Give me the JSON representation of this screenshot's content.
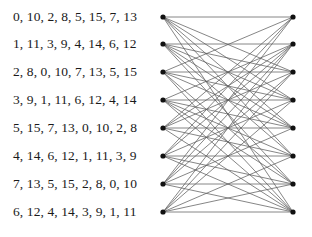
{
  "figure": {
    "width": 312,
    "height": 237,
    "background_color": "#ffffff",
    "node_color": "#111111",
    "edge_color": "#5e5e5e",
    "text_color": "#1a1a1a"
  },
  "labels": {
    "rows": [
      {
        "id": "row-1",
        "text": "0, 10, 2, 8, 5, 15, 7, 13",
        "values": [
          0,
          10,
          2,
          8,
          5,
          15,
          7,
          13
        ],
        "y": 17
      },
      {
        "id": "row-2",
        "text": "1, 11, 3, 9, 4, 14, 6, 12",
        "values": [
          1,
          11,
          3,
          9,
          4,
          14,
          6,
          12
        ],
        "y": 44
      },
      {
        "id": "row-3",
        "text": "2, 8, 0, 10, 7, 13, 5, 15",
        "values": [
          2,
          8,
          0,
          10,
          7,
          13,
          5,
          15
        ],
        "y": 72
      },
      {
        "id": "row-4",
        "text": "3, 9, 1, 11, 6, 12, 4, 14",
        "values": [
          3,
          9,
          1,
          11,
          6,
          12,
          4,
          14
        ],
        "y": 100
      },
      {
        "id": "row-5",
        "text": "5, 15, 7, 13, 0, 10, 2, 8",
        "values": [
          5,
          15,
          7,
          13,
          0,
          10,
          2,
          8
        ],
        "y": 128
      },
      {
        "id": "row-6",
        "text": "4, 14, 6, 12, 1, 11, 3, 9",
        "values": [
          4,
          14,
          6,
          12,
          1,
          11,
          3,
          9
        ],
        "y": 156
      },
      {
        "id": "row-7",
        "text": "7, 13, 5, 15, 2, 8, 0, 10",
        "values": [
          7,
          13,
          5,
          15,
          2,
          8,
          0,
          10
        ],
        "y": 184
      },
      {
        "id": "row-8",
        "text": "6, 12, 4, 14, 3, 9, 1, 11",
        "values": [
          6,
          12,
          4,
          14,
          3,
          9,
          1,
          11
        ],
        "y": 212
      }
    ]
  },
  "chart_data": {
    "type": "diagram",
    "subtype": "bipartite-graph",
    "title": "",
    "xlabel": "",
    "ylabel": "",
    "node_radius": 2.6,
    "left_nodes": [
      {
        "id": "L1",
        "x": 163,
        "y": 17
      },
      {
        "id": "L2",
        "x": 163,
        "y": 44
      },
      {
        "id": "L3",
        "x": 163,
        "y": 72
      },
      {
        "id": "L4",
        "x": 163,
        "y": 100
      },
      {
        "id": "L5",
        "x": 163,
        "y": 128
      },
      {
        "id": "L6",
        "x": 163,
        "y": 156
      },
      {
        "id": "L7",
        "x": 163,
        "y": 184
      },
      {
        "id": "L8",
        "x": 163,
        "y": 212
      }
    ],
    "right_nodes": [
      {
        "id": "R1",
        "x": 293,
        "y": 17
      },
      {
        "id": "R2",
        "x": 293,
        "y": 44
      },
      {
        "id": "R3",
        "x": 293,
        "y": 72
      },
      {
        "id": "R4",
        "x": 293,
        "y": 100
      },
      {
        "id": "R5",
        "x": 293,
        "y": 128
      },
      {
        "id": "R6",
        "x": 293,
        "y": 156
      },
      {
        "id": "R7",
        "x": 293,
        "y": 184
      },
      {
        "id": "R8",
        "x": 293,
        "y": 212
      }
    ],
    "edges": [
      {
        "from": "L1",
        "to": "R1"
      },
      {
        "from": "L1",
        "to": "R3"
      },
      {
        "from": "L1",
        "to": "R4"
      },
      {
        "from": "L1",
        "to": "R5"
      },
      {
        "from": "L1",
        "to": "R6"
      },
      {
        "from": "L1",
        "to": "R8"
      },
      {
        "from": "L2",
        "to": "R2"
      },
      {
        "from": "L2",
        "to": "R3"
      },
      {
        "from": "L2",
        "to": "R4"
      },
      {
        "from": "L2",
        "to": "R5"
      },
      {
        "from": "L2",
        "to": "R6"
      },
      {
        "from": "L2",
        "to": "R7"
      },
      {
        "from": "L3",
        "to": "R1"
      },
      {
        "from": "L3",
        "to": "R3"
      },
      {
        "from": "L3",
        "to": "R4"
      },
      {
        "from": "L3",
        "to": "R5"
      },
      {
        "from": "L3",
        "to": "R7"
      },
      {
        "from": "L3",
        "to": "R8"
      },
      {
        "from": "L4",
        "to": "R2"
      },
      {
        "from": "L4",
        "to": "R4"
      },
      {
        "from": "L4",
        "to": "R5"
      },
      {
        "from": "L4",
        "to": "R6"
      },
      {
        "from": "L4",
        "to": "R7"
      },
      {
        "from": "L4",
        "to": "R8"
      },
      {
        "from": "L5",
        "to": "R1"
      },
      {
        "from": "L5",
        "to": "R2"
      },
      {
        "from": "L5",
        "to": "R3"
      },
      {
        "from": "L5",
        "to": "R5"
      },
      {
        "from": "L5",
        "to": "R6"
      },
      {
        "from": "L5",
        "to": "R8"
      },
      {
        "from": "L6",
        "to": "R1"
      },
      {
        "from": "L6",
        "to": "R2"
      },
      {
        "from": "L6",
        "to": "R4"
      },
      {
        "from": "L6",
        "to": "R6"
      },
      {
        "from": "L6",
        "to": "R7"
      },
      {
        "from": "L6",
        "to": "R8"
      },
      {
        "from": "L7",
        "to": "R1"
      },
      {
        "from": "L7",
        "to": "R2"
      },
      {
        "from": "L7",
        "to": "R3"
      },
      {
        "from": "L7",
        "to": "R5"
      },
      {
        "from": "L7",
        "to": "R7"
      },
      {
        "from": "L7",
        "to": "R8"
      },
      {
        "from": "L8",
        "to": "R2"
      },
      {
        "from": "L8",
        "to": "R3"
      },
      {
        "from": "L8",
        "to": "R4"
      },
      {
        "from": "L8",
        "to": "R6"
      },
      {
        "from": "L8",
        "to": "R7"
      },
      {
        "from": "L8",
        "to": "R8"
      }
    ]
  }
}
